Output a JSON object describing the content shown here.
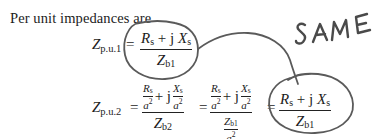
{
  "intro_text": "Per unit impedances are",
  "equation1": {
    "lhs_symbol": "Z",
    "lhs_subscript": "p.u.1",
    "equals": "=",
    "numerator": {
      "r": "R",
      "r_sub": "s",
      "plus_j": "+ j",
      "x": "X",
      "x_sub": "s"
    },
    "denominator": {
      "z": "Z",
      "z_sub": "b1"
    }
  },
  "equation2": {
    "lhs_symbol": "Z",
    "lhs_subscript": "p.u.2",
    "equals": "=",
    "term1": {
      "numerator": {
        "r": "R",
        "r_sub": "s",
        "r_den": "a",
        "r_den_exp": "2",
        "plus_j": "+ j",
        "x": "X",
        "x_sub": "s",
        "x_den": "a",
        "x_den_exp": "2"
      },
      "denominator": {
        "z": "Z",
        "z_sub": "b2"
      }
    },
    "equals2": "=",
    "term2": {
      "numerator": {
        "r": "R",
        "r_sub": "s",
        "r_den": "a",
        "r_den_exp": "2",
        "plus_j": "+ j",
        "x": "X",
        "x_sub": "s",
        "x_den": "a",
        "x_den_exp": "2"
      },
      "denominator": {
        "z": "Z",
        "z_sub": "b1",
        "z_den": "a",
        "z_den_exp": "2"
      }
    },
    "equals3": "=",
    "term3": {
      "numerator": {
        "r": "R",
        "r_sub": "s",
        "plus_j": "+ j",
        "x": "X",
        "x_sub": "s"
      },
      "denominator": {
        "z": "Z",
        "z_sub": "b1"
      }
    }
  },
  "annotation": {
    "text": "SAME",
    "stroke_color": "#5a5a5a"
  }
}
